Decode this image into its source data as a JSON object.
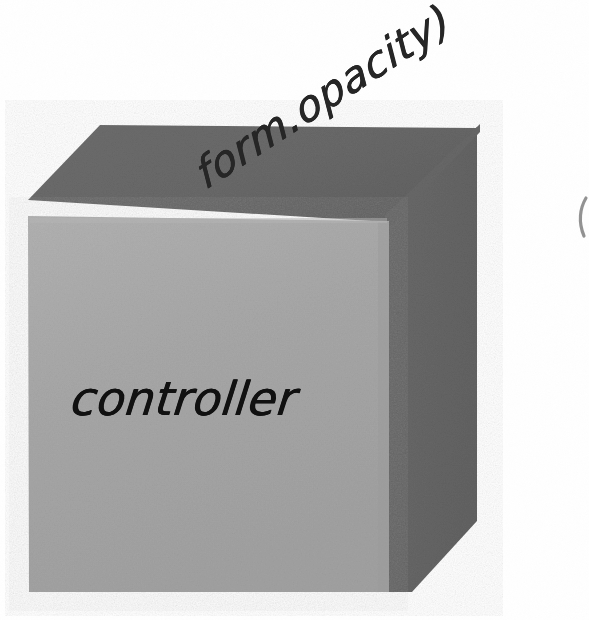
{
  "canvas": {
    "width": 589,
    "height": 620,
    "background": "#ffffff"
  },
  "diagram": {
    "type": "isometric-cube-sketch",
    "faces": {
      "front": {
        "name": "front-face",
        "color": "#a8a8a8",
        "points": "28,216 388,221 388,592 29,592"
      },
      "top": {
        "name": "top-face",
        "color": "#6a6a6a",
        "points": "28,200 100,125 477,128 388,222"
      },
      "side": {
        "name": "right-side-face",
        "color": "#686868",
        "points": "388,221 477,128 477,521 412,592 388,592"
      }
    },
    "labels": {
      "front_face_text": "controller",
      "annotation_text": "form.opacity)"
    },
    "colors": {
      "front_face": "#a8a8a8",
      "dark_faces": "#686868",
      "ink": "#1a1a1a",
      "background": "#ffffff"
    }
  },
  "annotations": {
    "edge_mark": "partial-ink-stroke"
  }
}
